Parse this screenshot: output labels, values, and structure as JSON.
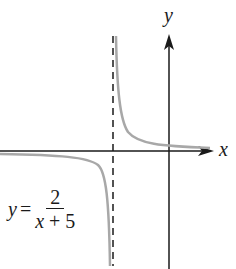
{
  "diagram": {
    "type": "function-graph",
    "axes": {
      "x_label": "x",
      "y_label": "y"
    },
    "equation": {
      "lhs": "y",
      "equals": "=",
      "numerator": "2",
      "denominator_var": "x",
      "denominator_rest": " + 5"
    },
    "asymptote": {
      "type": "vertical",
      "style": "dashed",
      "at": "x = -5"
    },
    "colors": {
      "axis": "#1a1a1a",
      "curve": "#a8a8a8",
      "asymptote": "#1a1a1a"
    }
  }
}
